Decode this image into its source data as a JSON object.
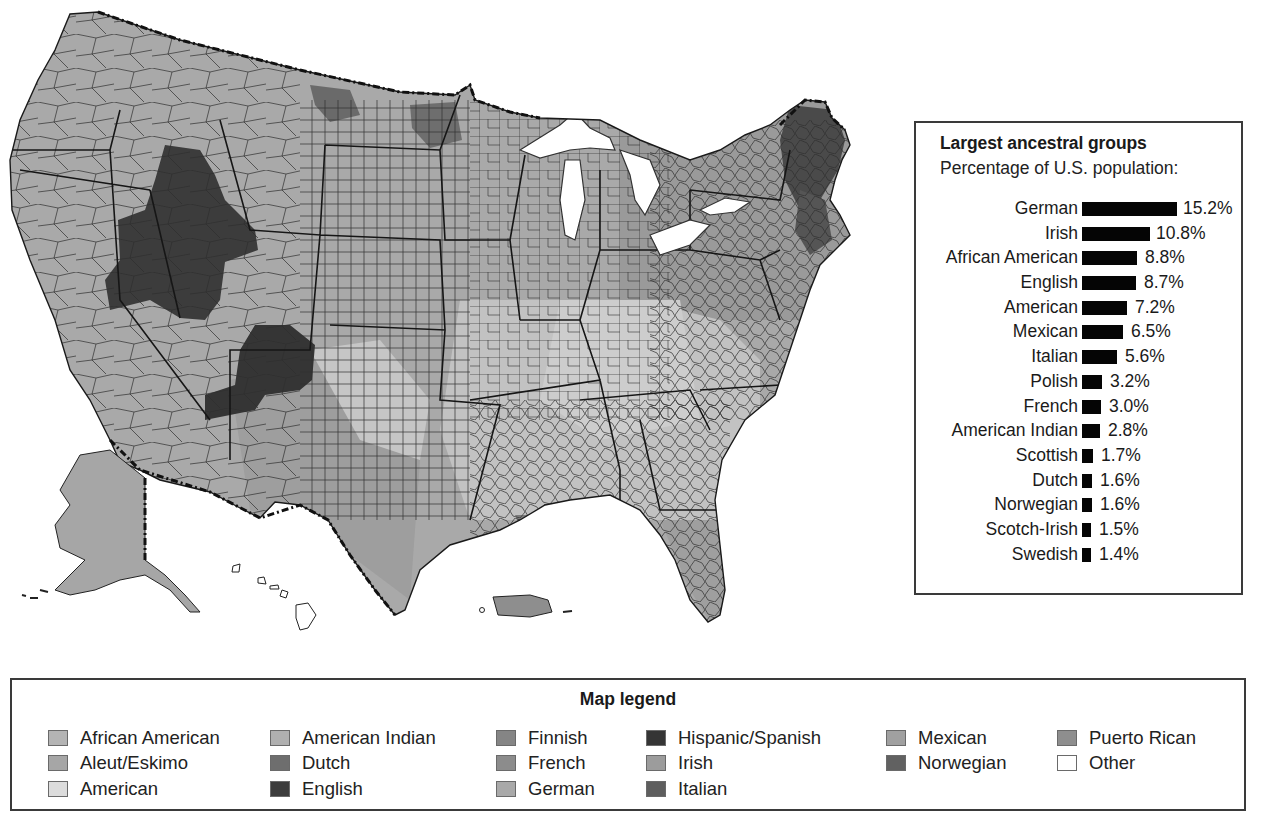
{
  "figure": {
    "bar_panel": {
      "title": "Largest ancestral groups",
      "subtitle": "Percentage of U.S. population:"
    },
    "legend": {
      "title": "Map legend",
      "columns": [
        [
          {
            "label": "African American",
            "color": "#b4b4b4"
          },
          {
            "label": "Aleut/Eskimo",
            "color": "#a6a6a6"
          },
          {
            "label": "American",
            "color": "#dcdcdc"
          }
        ],
        [
          {
            "label": "American Indian",
            "color": "#b0b0b0"
          },
          {
            "label": "Dutch",
            "color": "#6e6e6e"
          },
          {
            "label": "English",
            "color": "#3c3c3c"
          }
        ],
        [
          {
            "label": "Finnish",
            "color": "#858585"
          },
          {
            "label": "French",
            "color": "#8c8c8c"
          },
          {
            "label": "German",
            "color": "#a9a9a9"
          }
        ],
        [
          {
            "label": "Hispanic/Spanish",
            "color": "#353535"
          },
          {
            "label": "Irish",
            "color": "#9c9c9c"
          },
          {
            "label": "Italian",
            "color": "#5e5e5e"
          }
        ],
        [
          {
            "label": "Mexican",
            "color": "#a0a0a0"
          },
          {
            "label": "Norwegian",
            "color": "#616161"
          }
        ],
        [
          {
            "label": "Puerto Rican",
            "color": "#8e8e8e"
          },
          {
            "label": "Other",
            "color": "#ffffff"
          }
        ]
      ]
    }
  },
  "chart_data": {
    "type": "bar",
    "orientation": "horizontal",
    "title": "Largest ancestral groups",
    "subtitle": "Percentage of U.S. population:",
    "categories": [
      "German",
      "Irish",
      "African American",
      "English",
      "American",
      "Mexican",
      "Italian",
      "Polish",
      "French",
      "American Indian",
      "Scottish",
      "Dutch",
      "Norwegian",
      "Scotch-Irish",
      "Swedish"
    ],
    "values": [
      15.2,
      10.8,
      8.8,
      8.7,
      7.2,
      6.5,
      5.6,
      3.2,
      3.0,
      2.8,
      1.7,
      1.6,
      1.6,
      1.5,
      1.4
    ],
    "value_labels": [
      "15.2%",
      "10.8%",
      "8.8%",
      "8.7%",
      "7.2%",
      "6.5%",
      "5.6%",
      "3.2%",
      "3.0%",
      "2.8%",
      "1.7%",
      "1.6%",
      "1.6%",
      "1.5%",
      "1.4%"
    ],
    "unit": "%",
    "bar_color": "#050505",
    "grid": false,
    "xlabel": "",
    "ylabel": ""
  }
}
